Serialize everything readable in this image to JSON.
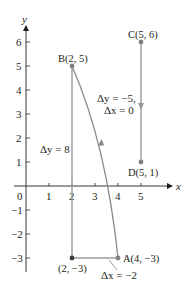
{
  "diagram": {
    "type": "coordinate-plane-increments",
    "colors": {
      "axis": "#231f20",
      "segment": "#9a9a9a",
      "curve": "#8a8a8a",
      "point": "#7f7f7f",
      "corner_point": "#3a3a3a",
      "text": "#231f20"
    },
    "axes": {
      "x_label": "x",
      "y_label": "y",
      "origin_label": "0",
      "x_ticks": [
        "1",
        "2",
        "3",
        "4",
        "5"
      ],
      "y_ticks_positive": [
        "1",
        "2",
        "3",
        "4",
        "5",
        "6"
      ],
      "y_ticks_negative": [
        "−1",
        "−2",
        "−3"
      ]
    },
    "points": {
      "A": {
        "label": "A(4, −3)",
        "x": 4,
        "y": -3
      },
      "B": {
        "label": "B(2, 5)",
        "x": 2,
        "y": 5
      },
      "C": {
        "label": "C(5, 6)",
        "x": 5,
        "y": 6
      },
      "D": {
        "label": "D(5, 1)",
        "x": 5,
        "y": 1
      },
      "corner": {
        "label": "(2, −3)",
        "x": 2,
        "y": -3
      }
    },
    "annotations": {
      "delta_y_AB": "Δy = 8",
      "delta_x_AB": "Δx = −2",
      "delta_y_CD": "Δy = −5,",
      "delta_x_CD": "Δx = 0"
    }
  }
}
